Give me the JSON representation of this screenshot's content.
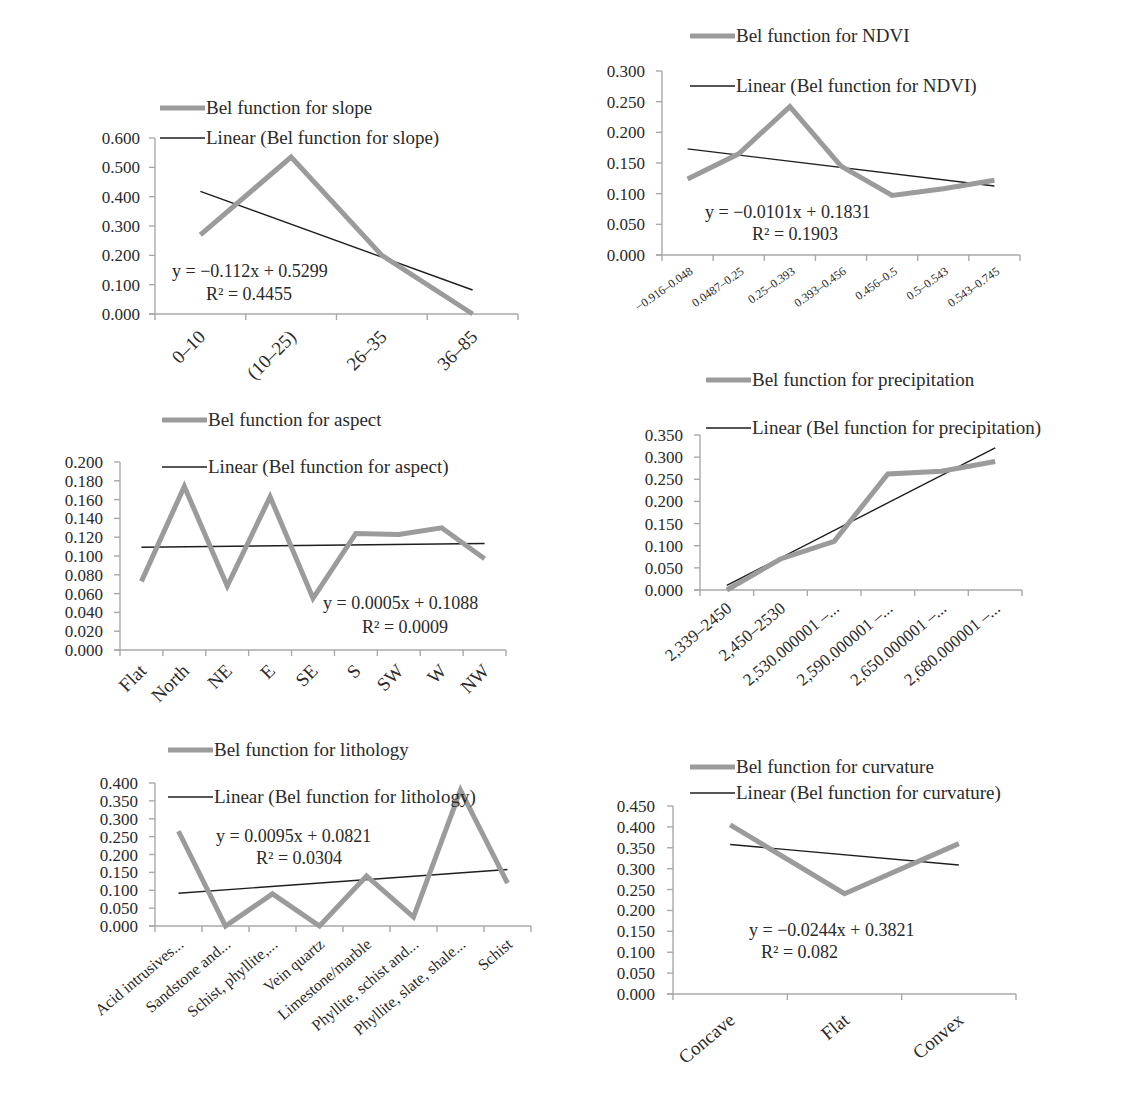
{
  "colors": {
    "series": "#9b9b9b",
    "trend": "#1e1e1e",
    "axis": "#a9a9a9"
  },
  "chart_data": [
    {
      "id": "slope",
      "type": "line",
      "title": "",
      "legend": [
        "Bel function for slope",
        "Linear (Bel function for slope)"
      ],
      "categories": [
        "0–10",
        "(10–25)",
        "26–35",
        "36–85"
      ],
      "series": [
        {
          "name": "Bel function for slope",
          "values": [
            0.27,
            0.535,
            0.2,
            0.0
          ]
        }
      ],
      "trendline": {
        "name": "Linear (Bel function for slope)",
        "slope": -0.112,
        "intercept": 0.5299,
        "equation": "y = −0.112x + 0.5299",
        "r2": "R² = 0.4455"
      },
      "yticks": [
        "0.000",
        "0.100",
        "0.200",
        "0.300",
        "0.400",
        "0.500",
        "0.600"
      ],
      "ylim": [
        0,
        0.6
      ]
    },
    {
      "id": "ndvi",
      "type": "line",
      "title": "",
      "legend": [
        "Bel function for NDVI",
        "Linear (Bel function for NDVI)"
      ],
      "categories": [
        "−0.916–0.048",
        "0.0487–0.25",
        "0.25–0.393",
        "0.393–0.456",
        "0.456–0.5",
        "0.5–0.543",
        "0.543–0.745"
      ],
      "series": [
        {
          "name": "Bel function for NDVI",
          "values": [
            0.124,
            0.165,
            0.242,
            0.145,
            0.097,
            0.108,
            0.122
          ]
        }
      ],
      "trendline": {
        "name": "Linear (Bel function for NDVI)",
        "slope": -0.0101,
        "intercept": 0.1831,
        "equation": "y = −0.0101x + 0.1831",
        "r2": "R² = 0.1903"
      },
      "yticks": [
        "0.000",
        "0.050",
        "0.100",
        "0.150",
        "0.200",
        "0.250",
        "0.300"
      ],
      "ylim": [
        0,
        0.3
      ]
    },
    {
      "id": "aspect",
      "type": "line",
      "title": "",
      "legend": [
        "Bel function for aspect",
        "Linear (Bel function for aspect)"
      ],
      "categories": [
        "Flat",
        "North",
        "NE",
        "E",
        "SE",
        "S",
        "SW",
        "W",
        "NW"
      ],
      "series": [
        {
          "name": "Bel function for aspect",
          "values": [
            0.073,
            0.174,
            0.068,
            0.163,
            0.055,
            0.124,
            0.123,
            0.13,
            0.097
          ]
        }
      ],
      "trendline": {
        "name": "Linear (Bel function for aspect)",
        "slope": 0.0005,
        "intercept": 0.1088,
        "equation": "y = 0.0005x + 0.1088",
        "r2": "R² = 0.0009"
      },
      "yticks": [
        "0.000",
        "0.020",
        "0.040",
        "0.060",
        "0.080",
        "0.100",
        "0.120",
        "0.140",
        "0.160",
        "0.180",
        "0.200"
      ],
      "ylim": [
        0,
        0.2
      ]
    },
    {
      "id": "precipitation",
      "type": "line",
      "title": "",
      "legend": [
        "Bel function for precipitation",
        "Linear (Bel function for precipitation)"
      ],
      "categories": [
        "2,339–2450",
        "2,450–2530",
        "2,530.000001 –...",
        "2,590.000001 –...",
        "2,650.000001 –...",
        "2,680.000001 –..."
      ],
      "series": [
        {
          "name": "Bel function for precipitation",
          "values": [
            0.0,
            0.07,
            0.11,
            0.262,
            0.268,
            0.29
          ]
        }
      ],
      "trendline": {
        "name": "Linear (Bel function for precipitation)",
        "slope": 0.0622,
        "intercept": -0.052,
        "equation": "",
        "r2": ""
      },
      "yticks": [
        "0.000",
        "0.050",
        "0.100",
        "0.150",
        "0.200",
        "0.250",
        "0.300",
        "0.350"
      ],
      "ylim": [
        0,
        0.35
      ]
    },
    {
      "id": "lithology",
      "type": "line",
      "title": "",
      "legend": [
        "Bel function for lithology",
        "Linear (Bel function for lithology)"
      ],
      "categories": [
        "Acid intrusives...",
        "Sandstone and...",
        "Schist, phyllite,...",
        "Vein quartz",
        "Limestone/marble",
        "Phyllite, schist and...",
        "Phyllite, slate, shale...",
        "Schist"
      ],
      "series": [
        {
          "name": "Bel function for lithology",
          "values": [
            0.265,
            0.0,
            0.09,
            0.0,
            0.14,
            0.025,
            0.38,
            0.12
          ]
        }
      ],
      "trendline": {
        "name": "Linear (Bel function for lithology)",
        "slope": 0.0095,
        "intercept": 0.0821,
        "equation": "y = 0.0095x + 0.0821",
        "r2": "R² = 0.0304"
      },
      "yticks": [
        "0.000",
        "0.050",
        "0.100",
        "0.150",
        "0.200",
        "0.250",
        "0.300",
        "0.350",
        "0.400"
      ],
      "ylim": [
        0,
        0.4
      ]
    },
    {
      "id": "curvature",
      "type": "line",
      "title": "",
      "legend": [
        "Bel function for curvature",
        "Linear (Bel function for curvature)"
      ],
      "categories": [
        "Concave",
        "Flat",
        "Convex"
      ],
      "series": [
        {
          "name": "Bel function for curvature",
          "values": [
            0.405,
            0.24,
            0.36
          ]
        }
      ],
      "trendline": {
        "name": "Linear (Bel function for curvature)",
        "slope": -0.0244,
        "intercept": 0.3821,
        "equation": "y = −0.0244x + 0.3821",
        "r2": "R² = 0.082"
      },
      "yticks": [
        "0.000",
        "0.050",
        "0.100",
        "0.150",
        "0.200",
        "0.250",
        "0.300",
        "0.350",
        "0.400",
        "0.450"
      ],
      "ylim": [
        0,
        0.45
      ]
    }
  ]
}
